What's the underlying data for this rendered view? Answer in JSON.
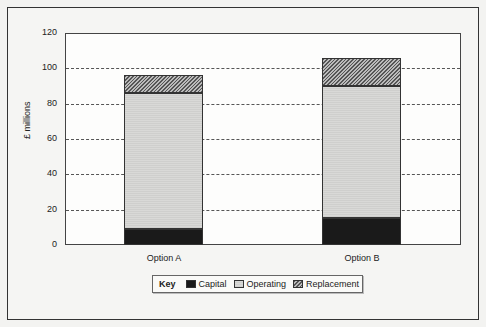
{
  "chart_data": {
    "type": "bar",
    "stacked": true,
    "title": "",
    "xlabel": "",
    "ylabel": "£ millions",
    "ylim": [
      0,
      120
    ],
    "yticks": [
      0,
      20,
      40,
      60,
      80,
      100,
      120
    ],
    "grid": "horizontal dashed",
    "categories": [
      "Option A",
      "Option B"
    ],
    "series": [
      {
        "name": "Capital",
        "values": [
          9,
          15
        ],
        "color": "#1a1a1a",
        "pattern": "solid"
      },
      {
        "name": "Operating",
        "values": [
          77,
          75
        ],
        "color": "#d4d4d2",
        "pattern": "fine horizontal lines"
      },
      {
        "name": "Replacement",
        "values": [
          10,
          16
        ],
        "color": "#888888",
        "pattern": "diagonal hatch"
      }
    ],
    "totals": [
      96,
      106
    ],
    "legend": {
      "title": "Key",
      "position": "bottom",
      "entries": [
        "Capital",
        "Operating",
        "Replacement"
      ]
    }
  },
  "axis": {
    "ylabel": "£ millions",
    "ticks": [
      "0",
      "20",
      "40",
      "60",
      "80",
      "100",
      "120"
    ]
  },
  "categories": [
    "Option A",
    "Option B"
  ],
  "legend": {
    "title": "Key",
    "items": [
      "Capital",
      "Operating",
      "Replacement"
    ]
  }
}
